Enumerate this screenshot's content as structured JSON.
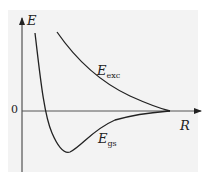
{
  "diagram": {
    "y_axis_label": "E",
    "x_axis_label": "R",
    "zero_tick_label": "0",
    "curves": [
      {
        "name": "excited state",
        "label_main": "E",
        "label_sub": "exc"
      },
      {
        "name": "ground state",
        "label_main": "E",
        "label_sub": "gs"
      }
    ],
    "colors": {
      "background": "#f3f3f3",
      "line": "#222222"
    }
  }
}
